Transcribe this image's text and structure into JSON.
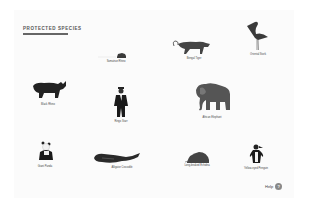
{
  "page": {
    "title": "PROTECTED SPECIES"
  },
  "species": [
    {
      "name": "Sumatran Rhino",
      "icon": "rhino-small-icon"
    },
    {
      "name": "Bengal Tiger",
      "icon": "tiger-icon"
    },
    {
      "name": "Oriental Stork",
      "icon": "stork-icon"
    },
    {
      "name": "Black Rhino",
      "icon": "rhino-icon"
    },
    {
      "name": "Ringo Starr",
      "icon": "human-icon"
    },
    {
      "name": "African Elephant",
      "icon": "elephant-icon"
    },
    {
      "name": "Giant Panda",
      "icon": "panda-icon"
    },
    {
      "name": "Alligator Crocodile",
      "icon": "crocodile-icon"
    },
    {
      "name": "Long-beaked Echidna",
      "icon": "echidna-icon"
    },
    {
      "name": "Yellow-eyed Penguin",
      "icon": "penguin-icon"
    }
  ],
  "footer": {
    "help_label": "Help",
    "help_icon_glyph": "?"
  },
  "colors": {
    "background": "#ffffff",
    "panel": "#fbfbfb",
    "silhouette": "#2a2a2a",
    "text": "#444444"
  }
}
